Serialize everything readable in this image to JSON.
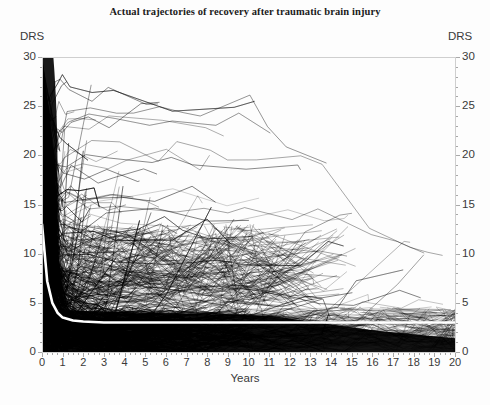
{
  "chart": {
    "title": "Actual trajectories of recovery after traumatic brain injury",
    "xlabel": "Years",
    "ylabel_left": "DRS",
    "ylabel_right": "DRS"
  },
  "chart_data": {
    "type": "line",
    "title": "Actual trajectories of recovery after traumatic brain injury",
    "subtitle": "",
    "xlabel": "Years",
    "ylabel": "DRS",
    "ylabel_right": "DRS",
    "xlim": [
      0,
      20
    ],
    "ylim": [
      0,
      30
    ],
    "xticks": [
      0,
      1,
      2,
      3,
      4,
      5,
      6,
      7,
      8,
      9,
      10,
      11,
      12,
      13,
      14,
      15,
      16,
      17,
      18,
      19,
      20
    ],
    "yticks": [
      0,
      5,
      10,
      15,
      20,
      25,
      30
    ],
    "xtick_labels": [
      "0",
      "1",
      "2",
      "3",
      "4",
      "5",
      "6",
      "7",
      "8",
      "9",
      "10",
      "11",
      "12",
      "13",
      "14",
      "15",
      "16",
      "17",
      "18",
      "19",
      "20"
    ],
    "ytick_labels": [
      "0",
      "5",
      "10",
      "15",
      "20",
      "25",
      "30"
    ],
    "grid": false,
    "legend": false,
    "minor_ticks_x": true,
    "minor_ticks_y": true,
    "series_colors": {
      "trajectories": "#000000",
      "mean_trajectory": "#ffffff",
      "axis": "#a8a8a8",
      "text": "#3a3a3a",
      "background": "#fdfdfd"
    },
    "mean_trajectory": {
      "name": "Mean trajectory (white overlay)",
      "x": [
        0,
        0.25,
        0.5,
        0.75,
        1,
        1.5,
        2,
        3,
        4,
        5,
        6,
        7,
        8,
        9,
        10,
        11,
        12,
        13,
        14,
        15,
        16,
        17,
        18,
        19,
        20
      ],
      "y": [
        13.0,
        7.2,
        5.0,
        4.0,
        3.5,
        3.2,
        3.1,
        3.0,
        3.0,
        3.0,
        3.0,
        3.0,
        3.0,
        3.0,
        3.0,
        3.0,
        3.0,
        3.0,
        3.0,
        3.0,
        3.0,
        3.0,
        3.0,
        3.0,
        3.0
      ]
    },
    "envelope": {
      "note": "Approximate upper boundary of the dense trajectory mass by year",
      "x": [
        0,
        1,
        2,
        3,
        4,
        5,
        6,
        7,
        8,
        9,
        10,
        11,
        12,
        13,
        14,
        15,
        16,
        17,
        18,
        19,
        20
      ],
      "upper": [
        30,
        29,
        28,
        27,
        27,
        26,
        26,
        25,
        25,
        25,
        27,
        23,
        21,
        20,
        19,
        15,
        13,
        12,
        11,
        11,
        11
      ],
      "lower": [
        0,
        0,
        0,
        0,
        0,
        0,
        0,
        0,
        0,
        0,
        0,
        0,
        0,
        0,
        0,
        0,
        0,
        0,
        0,
        0,
        0
      ]
    },
    "n_trajectories_approx": 600,
    "series": [
      {
        "name": "patient trajectories",
        "note": "individual DRS polylines, rendered as a dense overplotted bundle"
      }
    ]
  }
}
